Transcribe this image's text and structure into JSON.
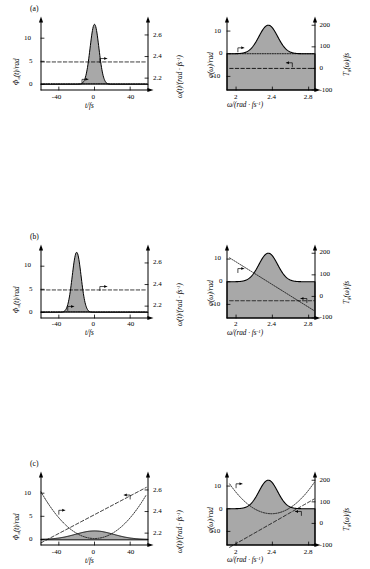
{
  "figure": {
    "panel_tags": [
      "(a)",
      "(b)",
      "(c)",
      "(d)",
      "(e)"
    ],
    "left_column": {
      "ylabel_left": "Φₐ(t)/rad",
      "ylabel_right": "ω(t)/(rad · fs⁻¹)",
      "xlabel": "t/fs",
      "xticks": [
        "-40",
        "0",
        "40"
      ],
      "yticks_left": [
        "0",
        "5",
        "10"
      ],
      "yticks_right": [
        "2.2",
        "2.4",
        "2.6"
      ]
    },
    "right_column": {
      "ylabel_left": "φ(ω)/rad",
      "ylabel_right": "T₉(ω)/fs",
      "xlabel": "ω/(rad · fs⁻¹)",
      "xticks": [
        "2",
        "2.4",
        "2.8"
      ],
      "yticks_left": [
        "-10",
        "0",
        "10"
      ],
      "yticks_right": [
        "-100",
        "0",
        "100",
        "200"
      ]
    }
  },
  "chart_data": {
    "type": "line",
    "panels": [
      {
        "tag": "(a)",
        "left": {
          "xlabel": "t/fs",
          "ylabel": "Φₐ(t)/rad",
          "ylabel_right": "ω(t)/(rad · fs⁻¹)",
          "xlim": [
            -60,
            60
          ],
          "ylim_left": [
            -1.2,
            13.5
          ],
          "ylim_right": [
            2.09,
            2.72
          ],
          "series": [
            {
              "name": "intensity-envelope",
              "style": "filled",
              "description": "narrow Gaussian centred at 0 fs, FWHM ~10 fs, peak 13 rad-units"
            },
            {
              "name": "temporal-phase",
              "style": "dotted",
              "description": "flat at 0 rad across pulse"
            },
            {
              "name": "instantaneous-frequency",
              "style": "dashed",
              "description": "constant 2.35 rad/fs"
            }
          ]
        },
        "right": {
          "xlabel": "ω/(rad · fs⁻¹)",
          "ylabel": "φ(ω)/rad",
          "ylabel_right": "T₉(ω)/fs",
          "xlim": [
            1.9,
            2.87
          ],
          "ylim_left": [
            -16,
            14
          ],
          "ylim_right": [
            -100,
            215
          ],
          "series": [
            {
              "name": "spectral-intensity",
              "style": "filled",
              "description": "Gaussian centred 2.35 rad/fs, peak 12.5"
            },
            {
              "name": "spectral-phase",
              "style": "dotted",
              "description": "flat at 0 rad"
            },
            {
              "name": "group-delay",
              "style": "dashed",
              "description": "constant 0 fs"
            }
          ]
        }
      },
      {
        "tag": "(b)",
        "left": {
          "xlim": [
            -60,
            60
          ],
          "series": [
            {
              "name": "intensity-envelope",
              "style": "filled",
              "description": "narrow Gaussian shifted to -20 fs, peak 13"
            },
            {
              "name": "temporal-phase",
              "style": "dotted",
              "description": "flat at 0 rad"
            },
            {
              "name": "instantaneous-frequency",
              "style": "dashed",
              "description": "constant 2.35 rad/fs"
            }
          ]
        },
        "right": {
          "series": [
            {
              "name": "spectral-intensity",
              "style": "filled",
              "description": "Gaussian centred 2.35 rad/fs"
            },
            {
              "name": "spectral-phase",
              "style": "dotted",
              "description": "linear decreasing from +10 rad at 1.95 to -13 rad at 2.87"
            },
            {
              "name": "group-delay",
              "style": "dashed",
              "description": "constant -20 fs"
            }
          ]
        }
      },
      {
        "tag": "(c)",
        "left": {
          "xlim": [
            -60,
            60
          ],
          "series": [
            {
              "name": "intensity-envelope",
              "style": "filled",
              "description": "broad stretched Gaussian centred 0 fs, peak 1.8"
            },
            {
              "name": "temporal-phase",
              "style": "dotted",
              "description": "parabola opening upward, minimum near 0, rising to 10 at both edges"
            },
            {
              "name": "instantaneous-frequency",
              "style": "dashed",
              "description": "linear chirp rising from 2.1 to 2.62 rad/fs"
            }
          ]
        },
        "right": {
          "series": [
            {
              "name": "spectral-intensity",
              "style": "filled",
              "description": "Gaussian centred 2.35 rad/fs"
            },
            {
              "name": "spectral-phase",
              "style": "dotted",
              "description": "upward parabola, minimum -2 rad near 2.38"
            },
            {
              "name": "group-delay",
              "style": "dashed",
              "description": "linear rising from -110 fs to +110 fs"
            }
          ]
        }
      },
      {
        "tag": "(d)",
        "left": {
          "xlim": [
            -60,
            60
          ],
          "series": [
            {
              "name": "intensity-envelope",
              "style": "filled",
              "description": "main pulse at 0 fs peak 8, satellite pulses at 22 fs and 42 fs"
            },
            {
              "name": "temporal-phase",
              "style": "dotted",
              "description": "step function with jumps at 22 fs and 42 fs"
            },
            {
              "name": "instantaneous-frequency",
              "style": "dashed",
              "description": "constant 2.37 rad/fs with step at 50 fs"
            }
          ]
        },
        "right": {
          "series": [
            {
              "name": "spectral-intensity",
              "style": "filled",
              "description": "Gaussian centred 2.35 rad/fs"
            },
            {
              "name": "spectral-phase",
              "style": "dotted",
              "description": "V-shaped, decreasing then increasing steeply"
            },
            {
              "name": "group-delay",
              "style": "dashed",
              "description": "modulated curve dipping near 2.35 and rising at both ends"
            }
          ]
        }
      },
      {
        "tag": "(e)",
        "left": {
          "xlim": [
            -60,
            60
          ],
          "series": [
            {
              "name": "intensity-envelope",
              "style": "filled",
              "description": "asymmetric pulse peaking near -35 fs with long tail"
            },
            {
              "name": "temporal-phase",
              "style": "dotted",
              "description": "low near -40 fs rising gradually toward +55 fs"
            },
            {
              "name": "instantaneous-frequency",
              "style": "dashed",
              "description": "rising stepwise from 2.15 to 2.62 rad/fs"
            }
          ]
        },
        "right": {
          "series": [
            {
              "name": "spectral-intensity",
              "style": "filled",
              "description": "Gaussian centred 2.35 rad/fs"
            },
            {
              "name": "spectral-phase",
              "style": "dotted",
              "description": "decreasing from 13 rad then rising steeply past 2.5"
            },
            {
              "name": "group-delay",
              "style": "dashed",
              "description": "flat near -60 fs then rising steeply after 2.5"
            }
          ]
        }
      }
    ]
  }
}
